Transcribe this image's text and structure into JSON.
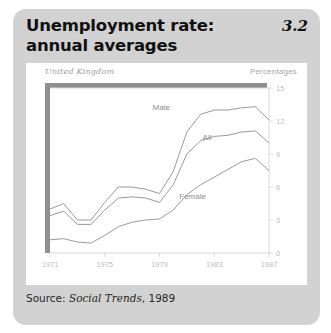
{
  "figure": {
    "title": "Unemployment rate:\nannual averages",
    "number": "3.2",
    "source_prefix": "Source: ",
    "source_work": "Social Trends",
    "source_suffix": ", 1989"
  },
  "chart_card": {
    "region_label": "United Kingdom",
    "units_label": "Percentages"
  },
  "colors": {
    "page_background": "#ffffff",
    "panel_background": "#d2d2d2",
    "card_background": "#ffffff",
    "title_text": "#111111",
    "frame_shadow": "#8f8f8f",
    "axis_line": "#d9d9d9",
    "tick_text": "#bdbdbd",
    "series_line": "#9a9a9a",
    "series_label": "#8d8d8d"
  },
  "chart_data": {
    "type": "line",
    "title": "Unemployment rate: annual averages",
    "subtitle": "United Kingdom",
    "xlabel": "",
    "ylabel": "Percentages",
    "xlim": [
      1971,
      1987
    ],
    "ylim": [
      0,
      15
    ],
    "grid": false,
    "legend": "inline-labels",
    "y_ticks": [
      15,
      12,
      9,
      6,
      3,
      0
    ],
    "y_axis_side": "right",
    "x_ticks": [
      1971,
      1975,
      1979,
      1983,
      1987
    ],
    "x": [
      1971,
      1972,
      1973,
      1974,
      1975,
      1976,
      1977,
      1978,
      1979,
      1980,
      1981,
      1982,
      1983,
      1984,
      1985,
      1986,
      1987
    ],
    "series": [
      {
        "name": "Male",
        "label": "Male",
        "values": [
          4.0,
          4.5,
          3.0,
          3.0,
          4.6,
          6.0,
          6.0,
          5.8,
          5.4,
          7.4,
          11.0,
          12.6,
          13.0,
          13.0,
          13.2,
          13.3,
          12.1
        ]
      },
      {
        "name": "All",
        "label": "All",
        "values": [
          3.4,
          3.8,
          2.6,
          2.6,
          3.9,
          5.0,
          5.1,
          5.0,
          4.6,
          6.2,
          9.0,
          10.2,
          10.6,
          10.7,
          11.0,
          11.1,
          10.0
        ]
      },
      {
        "name": "Female",
        "label": "Female",
        "values": [
          1.2,
          1.3,
          1.0,
          0.9,
          1.6,
          2.4,
          2.8,
          3.0,
          3.1,
          3.9,
          5.3,
          6.2,
          6.9,
          7.6,
          8.3,
          8.6,
          7.5
        ]
      }
    ],
    "annotations": [
      {
        "text": "Male",
        "series": "Male"
      },
      {
        "text": "All",
        "series": "All"
      },
      {
        "text": "Female",
        "series": "Female"
      }
    ]
  }
}
